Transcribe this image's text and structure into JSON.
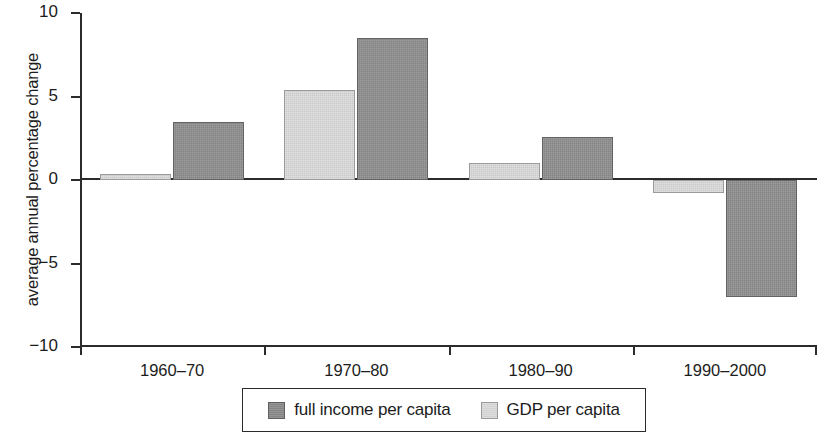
{
  "chart_data": {
    "type": "bar",
    "title": "",
    "xlabel": "",
    "ylabel": "average annual percentage change",
    "categories": [
      "1960–70",
      "1970–80",
      "1980–90",
      "1990–2000"
    ],
    "series": [
      {
        "name": "full income per capita",
        "color": "#909090",
        "values": [
          3.5,
          8.5,
          2.6,
          -7.0
        ]
      },
      {
        "name": "GDP per capita",
        "color": "#d9d9d9",
        "values": [
          0.35,
          5.4,
          1.0,
          -0.8
        ]
      }
    ],
    "ylim": [
      -10,
      10
    ],
    "yticks": [
      10,
      5,
      0,
      -5,
      -10
    ],
    "ytick_labels": [
      "10",
      "5",
      "0",
      "−5",
      "−10"
    ],
    "grid": false,
    "legend_position": "bottom-center",
    "zero_line": true,
    "bar_order_in_group": [
      "GDP per capita",
      "full income per capita"
    ]
  },
  "legend": {
    "entries": [
      {
        "label": "full income per capita",
        "swatch": "dark-gray-swatch"
      },
      {
        "label": "GDP per capita",
        "swatch": "light-gray-swatch"
      }
    ]
  }
}
